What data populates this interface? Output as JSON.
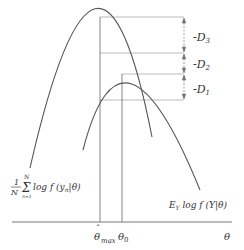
{
  "diagram": {
    "axis_label": "θ",
    "ticks": {
      "theta_max": {
        "base": "θ",
        "hat": "ˆ",
        "sub": "max"
      },
      "theta_0": {
        "base": "θ",
        "sub": "0"
      }
    },
    "curves": {
      "empirical": {
        "frac_num": "1",
        "frac_den": "N",
        "sum": "Σ",
        "sum_top": "N",
        "sum_bottom": "n=1",
        "body": "log f (y",
        "body_sub": "n",
        "body_end": "|θ)"
      },
      "expected": {
        "prefix": "E",
        "prefix_sub": "Y",
        "body": " log f (Y|θ)"
      }
    },
    "differences": [
      {
        "label": "-D",
        "sub": "3"
      },
      {
        "label": "-D",
        "sub": "2"
      },
      {
        "label": "-D",
        "sub": "1"
      }
    ],
    "colors": {
      "curve": "#555555",
      "guide": "#999999",
      "text": "#333333"
    }
  }
}
